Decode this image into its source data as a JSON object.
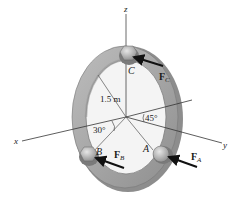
{
  "figure": {
    "type": "statics-free-body-diagram"
  },
  "axes": {
    "x_label": "x",
    "y_label": "y",
    "z_label": "z"
  },
  "points": {
    "A": "A",
    "B": "B",
    "C": "C"
  },
  "forces": {
    "FA": {
      "main": "F",
      "sub": "A"
    },
    "FB": {
      "main": "F",
      "sub": "B"
    },
    "FC": {
      "main": "F",
      "sub": "C"
    }
  },
  "dimensions": {
    "radius": "1.5 m",
    "angle_B": "30°",
    "angle_A": "45°"
  },
  "colors": {
    "ring_outer": "#9c9c9c",
    "ring_face": "#c4c4c4",
    "ring_inner_edge": "#8a8a8a",
    "knob": "#b0b0b0",
    "line": "#333333",
    "arrow": "#111111"
  }
}
